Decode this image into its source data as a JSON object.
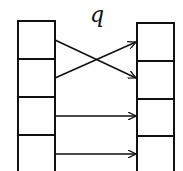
{
  "diagram": {
    "label": "q",
    "left_column": {
      "cells": 4
    },
    "right_column": {
      "cells": 4
    },
    "mappings": [
      {
        "from": 1,
        "to": 2
      },
      {
        "from": 2,
        "to": 1
      },
      {
        "from": 3,
        "to": 3
      },
      {
        "from": 4,
        "to": 4
      }
    ]
  }
}
